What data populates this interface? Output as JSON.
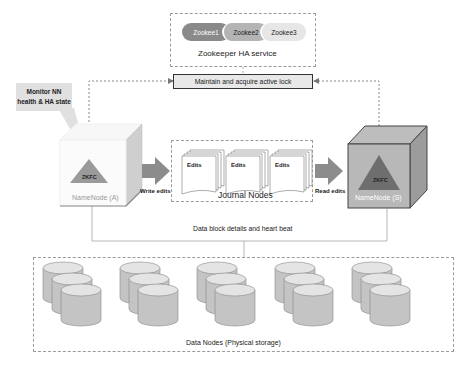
{
  "zookeeper": {
    "title": "Zookeeper HA service",
    "nodes": [
      "Zookee1",
      "Zookee2",
      "Zookee3"
    ],
    "colors": [
      "#8a8a8a",
      "#b4b4b4",
      "#e6e6e6"
    ]
  },
  "lock_box": {
    "label": "Maintain and acquire active lock"
  },
  "callout": {
    "line1": "Monitor NN",
    "line2": "health & HA state"
  },
  "namenode_active": {
    "label": "NameNode (A)",
    "zkfc": "ZKFC"
  },
  "namenode_standby": {
    "label": "NameNode (S)",
    "zkfc": "ZKFC"
  },
  "journal": {
    "title": "Journal Nodes",
    "edits": [
      "Edits",
      "Edits",
      "Edits"
    ]
  },
  "arrows": {
    "write": "Write edits",
    "read": "Read edits"
  },
  "heartbeat": {
    "label": "Data block details and heart beat"
  },
  "datanodes": {
    "title": "Data Nodes (Physical storage)",
    "group_count": 5
  }
}
